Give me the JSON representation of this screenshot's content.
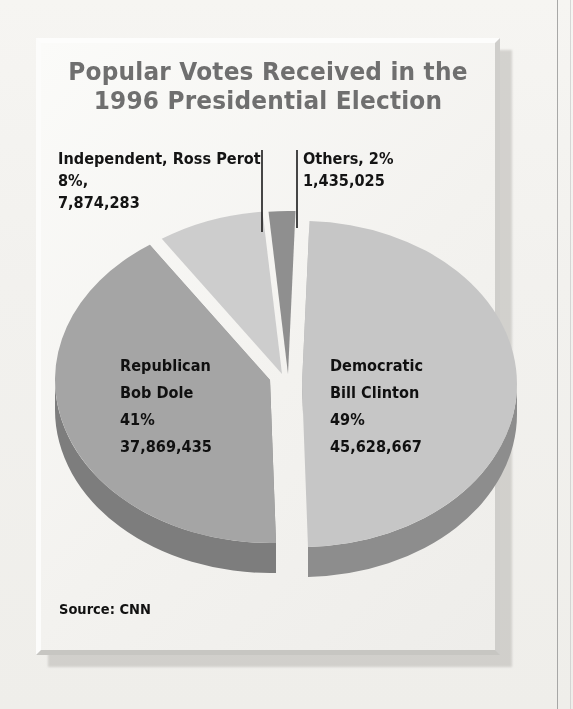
{
  "page": {
    "background_color": "#f4f3f0",
    "panel_color": "#f3f2ef",
    "rule_color": "#9a9a9a"
  },
  "title": "Popular Votes Received in the\n1996 Presidential Election",
  "source_note": "Source: CNN",
  "callouts": {
    "perot": "Independent, Ross Perot\n8%,\n7,874,283",
    "others": "Others, 2%\n1,435,025"
  },
  "slice_labels": {
    "republican": "Republican\nBob Dole\n41%\n37,869,435",
    "democratic": "Democratic\nBill Clinton\n49%\n45,628,667"
  },
  "chart_data": {
    "type": "pie",
    "title": "Popular Votes Received in the 1996 Presidential Election",
    "xlabel": "",
    "ylabel": "",
    "grid": false,
    "legend": "none",
    "style": "3d-exploded-pie",
    "source": "Source: CNN",
    "categories": [
      "Democratic Bill Clinton",
      "Republican Bob Dole",
      "Independent, Ross Perot",
      "Others"
    ],
    "values": [
      45628667,
      37869435,
      7874283,
      1435025
    ],
    "percents": [
      49,
      41,
      8,
      2
    ],
    "value_labels": [
      "45,628,667",
      "37,869,435",
      "7,874,283",
      "1,435,025"
    ],
    "percent_labels": [
      "49%",
      "41%",
      "8%",
      "2%"
    ],
    "slices": [
      {
        "name": "Democratic Bill Clinton",
        "party": "Democratic",
        "candidate": "Bill Clinton",
        "percent": 49,
        "percent_label": "49%",
        "votes": 45628667,
        "votes_label": "45,628,667",
        "color": "#c6c6c6",
        "side_color": "#8d8d8d",
        "exploded": true
      },
      {
        "name": "Republican Bob Dole",
        "party": "Republican",
        "candidate": "Bob Dole",
        "percent": 41,
        "percent_label": "41%",
        "votes": 37869435,
        "votes_label": "37,869,435",
        "color": "#a5a5a5",
        "side_color": "#7d7d7d",
        "exploded": true
      },
      {
        "name": "Independent, Ross Perot",
        "party": "Independent",
        "candidate": "Ross Perot",
        "percent": 8,
        "percent_label": "8%",
        "votes": 7874283,
        "votes_label": "7,874,283",
        "color": "#cdcdcd",
        "side_color": "#949494",
        "exploded": false
      },
      {
        "name": "Others",
        "party": "Others",
        "candidate": "",
        "percent": 2,
        "percent_label": "2%",
        "votes": 1435025,
        "votes_label": "1,435,025",
        "color": "#8f8f8f",
        "side_color": "#6f6f6f",
        "exploded": false
      }
    ]
  }
}
